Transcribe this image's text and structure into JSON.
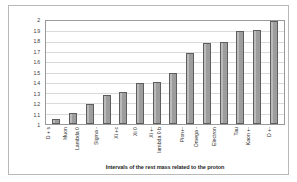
{
  "chart_data": {
    "type": "bar",
    "title": "",
    "xlabel": "Intervals of the rest mass related to the proton",
    "ylabel": "",
    "ylim": [
      1,
      2
    ],
    "grid": true,
    "legend": "none",
    "yticks": [
      "2",
      "1.9",
      "1.8",
      "1.7",
      "1.6",
      "1.5",
      "1.4",
      "1.3",
      "1.2",
      "1.1",
      "1"
    ],
    "categories": [
      "D + s",
      "Muon",
      "Lambda 0",
      "Sigma -",
      "Xi +c",
      "Xi 0",
      "Xi +-",
      "lambda 0 b",
      "Pion+-",
      "Omega -",
      "Electron",
      "Tau",
      "Kaon +-",
      "D +-"
    ],
    "values": [
      1.05,
      1.11,
      1.19,
      1.28,
      1.31,
      1.4,
      1.41,
      1.5,
      1.69,
      1.79,
      1.8,
      1.9,
      1.91,
      2.0
    ]
  },
  "style": {
    "bar_fill": "#9d9d9d",
    "bar_border": "#5d5d5d",
    "grid_color": "#dadada",
    "plot_border": "#9a9a9a",
    "frame_border": "#b8b8b8",
    "background": "#ffffff"
  }
}
